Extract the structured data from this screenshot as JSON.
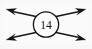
{
  "figure": {
    "background_color": "#fbfbfb",
    "ink_color": "#141414",
    "node": {
      "label": "14",
      "shape": "circle",
      "fill_color": "#ffffff",
      "stroke_color": "#141414",
      "center_x": 46,
      "center_y": 24.5,
      "radius": 12.6
    },
    "arrows": [
      {
        "name": "arrow-up-left",
        "direction": "up-left",
        "label": "",
        "from_x": 36.0,
        "from_y": 16.6,
        "to_x": 9.0,
        "to_y": 10.5
      },
      {
        "name": "arrow-up-right",
        "direction": "up-right",
        "label": "",
        "from_x": 56.0,
        "from_y": 16.6,
        "to_x": 83.0,
        "to_y": 10.5
      },
      {
        "name": "arrow-down-left",
        "direction": "down-left",
        "label": "",
        "from_x": 36.0,
        "from_y": 32.4,
        "to_x": 9.0,
        "to_y": 38.5
      },
      {
        "name": "arrow-down-right",
        "direction": "down-right",
        "label": "",
        "from_x": 56.0,
        "from_y": 32.4,
        "to_x": 83.0,
        "to_y": 38.5
      }
    ]
  }
}
